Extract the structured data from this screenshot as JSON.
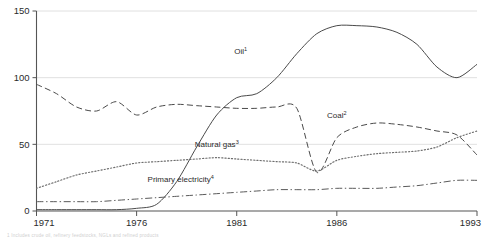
{
  "chart_data": {
    "type": "line",
    "title": "",
    "subtitle": "",
    "xlabel": "",
    "ylabel": "",
    "xlim": [
      1971,
      1993
    ],
    "ylim": [
      0,
      150
    ],
    "grid": true,
    "grid_axis": "y",
    "legend": "inline-annotations",
    "xticks": [
      "1971",
      "1976",
      "1981",
      "1986",
      "1993"
    ],
    "xtick_values": [
      1971,
      1976,
      1981,
      1986,
      1993
    ],
    "yticks": [
      "0",
      "50",
      "100",
      "150"
    ],
    "ytick_values": [
      0,
      50,
      100,
      150
    ],
    "x": [
      1971,
      1972,
      1973,
      1974,
      1975,
      1976,
      1977,
      1978,
      1979,
      1980,
      1981,
      1982,
      1983,
      1984,
      1985,
      1986,
      1987,
      1988,
      1989,
      1990,
      1991,
      1992,
      1993
    ],
    "series": [
      {
        "name": "Oil",
        "label": "Oil",
        "footnote_marker": "1",
        "style": "solid",
        "color": "#4a4a4a",
        "label_x": 1981.2,
        "label_y": 118,
        "values": [
          1,
          1,
          1,
          1,
          1,
          2,
          5,
          22,
          48,
          72,
          85,
          88,
          100,
          118,
          133,
          139,
          139,
          138,
          134,
          125,
          108,
          100,
          110
        ]
      },
      {
        "name": "Coal",
        "label": "Coal",
        "footnote_marker": "2",
        "style": "dashed",
        "color": "#4a4a4a",
        "label_x": 1986.0,
        "label_y": 70,
        "values": [
          95,
          88,
          78,
          75,
          82,
          72,
          78,
          80,
          79,
          78,
          77,
          77,
          78,
          77,
          29,
          55,
          63,
          66,
          65,
          63,
          60,
          57,
          42
        ]
      },
      {
        "name": "Natural gas",
        "label": "Natural gas",
        "footnote_marker": "3",
        "style": "dotted",
        "color": "#6d6d6d",
        "label_x": 1980.0,
        "label_y": 48,
        "values": [
          17,
          22,
          27,
          30,
          33,
          36,
          37,
          38,
          39,
          40,
          39,
          38,
          37,
          36,
          30,
          38,
          41,
          43,
          44,
          45,
          48,
          55,
          60
        ]
      },
      {
        "name": "Primary electricity",
        "label": "Primary electricity",
        "footnote_marker": "4",
        "style": "dashdot",
        "color": "#5a5a5a",
        "label_x": 1978.2,
        "label_y": 22,
        "values": [
          7,
          7,
          7,
          7,
          8,
          9,
          10,
          11,
          12,
          13,
          14,
          15,
          16,
          16,
          16,
          17,
          17,
          17,
          18,
          19,
          21,
          23,
          23
        ]
      }
    ]
  },
  "footnote": {
    "text": "1 Includes crude oil, refinery feedstocks, NGLs and refined products"
  }
}
